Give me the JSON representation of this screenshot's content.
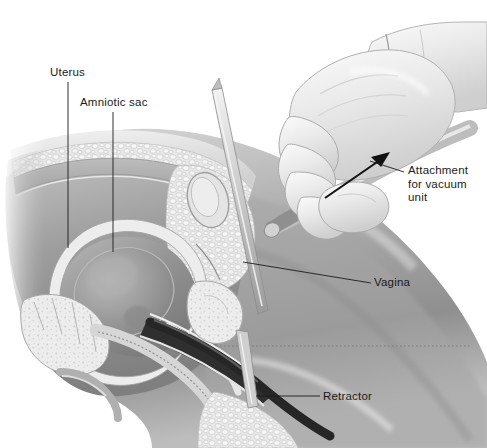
{
  "figure": {
    "style": "grayscale medical line illustration",
    "width": 487,
    "height": 448,
    "background_color": "#ffffff"
  },
  "labels": [
    {
      "id": "uterus",
      "text": "Uterus",
      "x": 50,
      "y": 66
    },
    {
      "id": "amniotic",
      "text": "Amniotic sac",
      "x": 80,
      "y": 96
    },
    {
      "id": "attachment",
      "text": "Attachment\nfor vacuum\nunit",
      "x": 408,
      "y": 164
    },
    {
      "id": "vagina",
      "text": "Vagina",
      "x": 374,
      "y": 276
    },
    {
      "id": "retractor",
      "text": "Retractor",
      "x": 323,
      "y": 390
    }
  ],
  "leader_lines": [
    {
      "id": "uterus-leader",
      "from": [
        68,
        82
      ],
      "to": [
        68,
        248
      ]
    },
    {
      "id": "amniotic-leader",
      "from": [
        113,
        112
      ],
      "to": [
        113,
        252
      ]
    },
    {
      "id": "attachment-leader",
      "from": [
        404,
        172
      ],
      "to": [
        370,
        160
      ]
    },
    {
      "id": "vagina-leader",
      "from": [
        370,
        283
      ],
      "to": [
        243,
        262
      ]
    },
    {
      "id": "retractor-leader",
      "from": [
        320,
        396
      ],
      "to": [
        256,
        396
      ]
    }
  ],
  "annotations": [
    {
      "id": "vacuum-direction-arrow",
      "kind": "arrow",
      "from": [
        325,
        197
      ],
      "to": [
        388,
        155
      ],
      "meaning": "direction of suction toward vacuum unit"
    }
  ],
  "anatomy": [
    {
      "id": "abdominal-skin",
      "label": "abdominal skin surface"
    },
    {
      "id": "subcutaneous-fat",
      "label": "subcutaneous fatty tissue"
    },
    {
      "id": "abdominal-muscle",
      "label": "abdominal muscle wall"
    },
    {
      "id": "uterus-body",
      "label": "uterus"
    },
    {
      "id": "amniotic-sac",
      "label": "amniotic sac"
    },
    {
      "id": "bladder",
      "label": "urinary bladder"
    },
    {
      "id": "pubic-bone",
      "label": "pubic symphysis"
    },
    {
      "id": "sacrum",
      "label": "sacrum and coccyx"
    },
    {
      "id": "rectum",
      "label": "rectum"
    },
    {
      "id": "vaginal-canal",
      "label": "vaginal canal"
    },
    {
      "id": "thigh",
      "label": "thigh"
    }
  ],
  "instruments": [
    {
      "id": "cannula",
      "label": "aspiration cannula"
    },
    {
      "id": "retractor-rod",
      "label": "retractor"
    },
    {
      "id": "tenaculum",
      "label": "long thin instrument entering vagina"
    }
  ],
  "hand": {
    "id": "gloved-hand",
    "label": "gloved clinician hand gripping cannula",
    "glove_color": "#e9e9e9",
    "cuff_color": "#d8d8d8"
  },
  "palette": {
    "ink": "#1b1b1b",
    "tissue_dark": "#6e6e6e",
    "tissue_mid": "#9a9a9a",
    "tissue_light": "#c9c9c9",
    "fat_light": "#e3e3e3",
    "bone": "#efefef",
    "instrument_dark": "#2a2a2a",
    "skin_mid": "#a8a8a8"
  }
}
